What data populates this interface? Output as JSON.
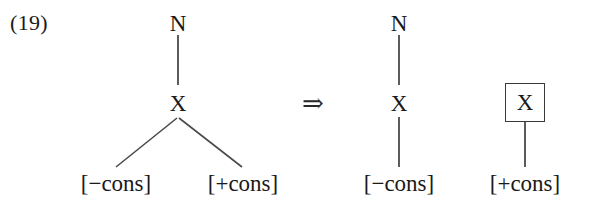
{
  "figure": {
    "example_number": "(19)",
    "derivation_arrow": "⇒",
    "background_color": "#ffffff",
    "ink_color": "#1a1a1a"
  },
  "input_tree": {
    "root_label": "N",
    "intermediate_label": "X",
    "left_leaf_label": "[−cons]",
    "right_leaf_label": "[+cons]"
  },
  "output_tree": {
    "root_label": "N",
    "intermediate_label": "X",
    "leaf_label": "[−cons]"
  },
  "detached_node": {
    "boxed_label": "X",
    "leaf_label": "[+cons]",
    "box_border_color": "#3a3a3a"
  }
}
